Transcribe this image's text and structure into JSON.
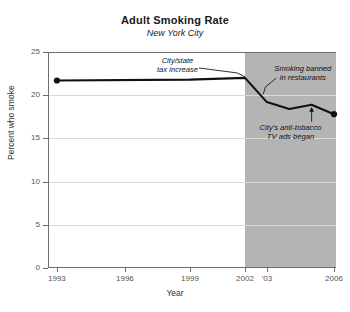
{
  "chart_data": {
    "type": "line",
    "title": "Adult Smoking Rate",
    "subtitle": "New York City",
    "xlabel": "Year",
    "ylabel": "Percent who smoke",
    "ylim": [
      0,
      25
    ],
    "yticks": [
      0,
      5,
      10,
      15,
      20,
      25
    ],
    "ytick_labels": [
      "0",
      "5",
      "10",
      "15",
      "20",
      "25"
    ],
    "grid": "horizontal",
    "legend": "none",
    "xlim": [
      1993,
      2006
    ],
    "xticks": [
      1993,
      1996,
      1999,
      2002,
      2003,
      2006
    ],
    "xtick_labels": [
      "1993",
      "1996",
      "1999",
      "2002",
      "'03",
      "2006"
    ],
    "x": [
      1993,
      1999,
      2002,
      2003,
      2004,
      2005,
      2006
    ],
    "values": [
      21.7,
      21.8,
      22.0,
      19.2,
      18.4,
      18.9,
      17.8
    ],
    "series": [
      {
        "name": "Percent who smoke",
        "x": [
          1993,
          1999,
          2002,
          2003,
          2004,
          2005,
          2006
        ],
        "values": [
          21.7,
          21.8,
          22.0,
          19.2,
          18.4,
          18.9,
          17.8
        ],
        "color": "#111111",
        "marker_points": [
          {
            "x": 1993,
            "y": 21.7
          },
          {
            "x": 2006,
            "y": 17.8
          }
        ]
      }
    ],
    "shaded_region": {
      "label": "",
      "x_start": 2002,
      "x_end": 2006,
      "color": "#b4b4b4"
    },
    "annotations": [
      {
        "id": "tax-increase",
        "text_lines": [
          "City/state",
          "tax increase"
        ],
        "target_x": 2002,
        "target_y": 22.0
      },
      {
        "id": "smoking-banned",
        "text_lines": [
          "Smoking banned",
          "in restaurants"
        ],
        "target_x": 2002.7,
        "target_y": 20.0
      },
      {
        "id": "tv-ads",
        "text_lines": [
          "City's anti-tobacco",
          "TV ads began"
        ],
        "target_x": 2005,
        "target_y": 18.9
      }
    ]
  },
  "annotation_text": {
    "tax_increase_line1": "City/state",
    "tax_increase_line2": "tax increase",
    "smoking_banned_line1": "Smoking banned",
    "smoking_banned_line2": "in restaurants",
    "tv_ads_line1": "City's anti-tobacco",
    "tv_ads_line2": "TV ads began"
  }
}
